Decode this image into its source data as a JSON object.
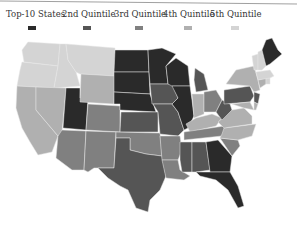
{
  "legend": [
    {
      "label": "Top-10 States",
      "color": "#2a2a2a"
    },
    {
      "label": "2nd Quintile",
      "color": "#555555"
    },
    {
      "label": "3rd Quintile",
      "color": "#808080"
    },
    {
      "label": "4th Quintile",
      "color": "#b0b0b0"
    },
    {
      "label": "5th Quintile",
      "color": "#d4d4d4"
    }
  ],
  "map": {
    "type": "choropleth",
    "region": "United States",
    "tiers": {
      "top10": [
        "Maine",
        "North Dakota",
        "South Dakota",
        "Minnesota",
        "Wisconsin",
        "Nebraska",
        "Utah",
        "Illinois",
        "Georgia",
        "Florida"
      ],
      "q2": [
        "Texas",
        "Kansas",
        "Iowa",
        "Missouri",
        "Michigan",
        "Pennsylvania",
        "Mississippi",
        "Alabama",
        "West Virginia",
        "New Jersey"
      ],
      "q3": [
        "Arizona",
        "New Mexico",
        "Colorado",
        "Oklahoma",
        "Arkansas",
        "Louisiana",
        "Ohio",
        "Tennessee",
        "South Carolina",
        "Wyoming"
      ],
      "q4": [
        "California",
        "Nevada",
        "Indiana",
        "Kentucky",
        "Virginia",
        "North Carolina",
        "New York",
        "Maryland",
        "Delaware",
        "Connecticut"
      ],
      "q5": [
        "Washington",
        "Oregon",
        "Idaho",
        "Montana",
        "Vermont",
        "New Hampshire",
        "Massachusetts",
        "Rhode Island"
      ]
    }
  }
}
